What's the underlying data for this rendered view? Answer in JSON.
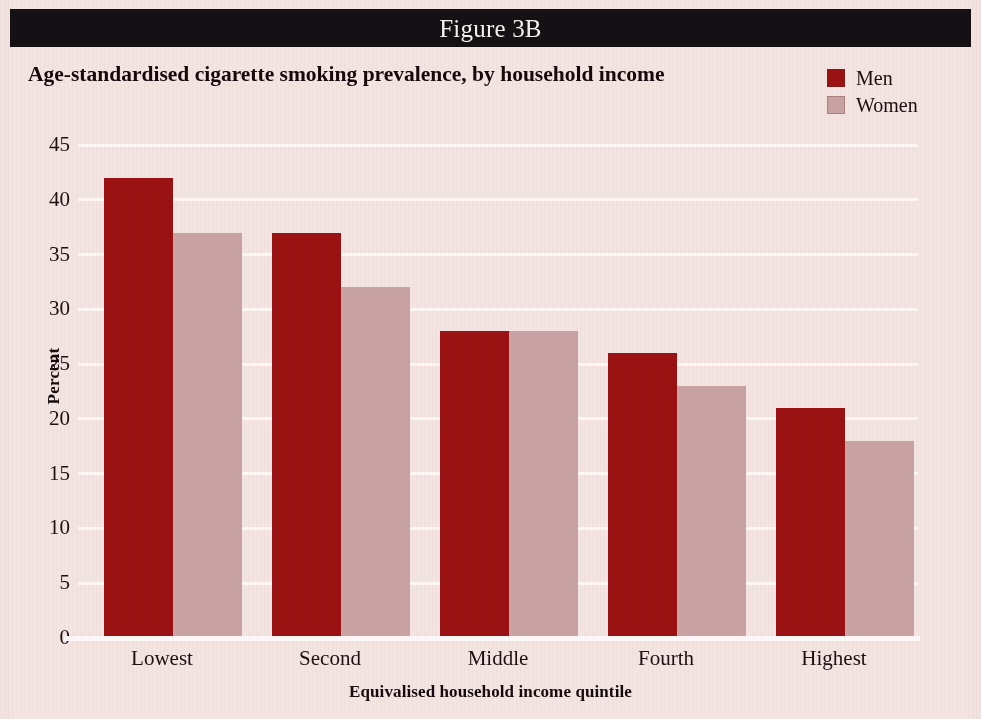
{
  "figure": {
    "banner_label": "Figure 3B",
    "title": "Age-standardised cigarette smoking prevalence, by household income"
  },
  "legend": {
    "items": [
      {
        "label": "Men",
        "color": "#9c1213"
      },
      {
        "label": "Women",
        "color": "#c9a3a4"
      }
    ]
  },
  "colors": {
    "background": "#f3e3e1",
    "banner": "#151013",
    "gridline": "#fdf6f5",
    "men": "#9c1213",
    "women": "#c9a3a4",
    "text": "#1e0f12"
  },
  "chart_data": {
    "type": "bar",
    "title": "Age-standardised cigarette smoking prevalence, by household income",
    "xlabel": "Equivalised household income quintile",
    "ylabel": "Percent",
    "categories": [
      "Lowest",
      "Second",
      "Middle",
      "Fourth",
      "Highest"
    ],
    "series": [
      {
        "name": "Men",
        "color": "#9c1213",
        "values": [
          42,
          37,
          28,
          26,
          21
        ]
      },
      {
        "name": "Women",
        "color": "#c9a3a4",
        "values": [
          37,
          32,
          28,
          23,
          18
        ]
      }
    ],
    "ylim": [
      0,
      45
    ],
    "ytick_values": [
      0,
      5,
      10,
      15,
      20,
      25,
      30,
      35,
      40,
      45
    ],
    "ytick_labels": [
      "0",
      "5",
      "10",
      "15",
      "20",
      "25",
      "30",
      "35",
      "40",
      "45"
    ],
    "grid": true,
    "grid_axis": "y",
    "legend_position": "top-right",
    "bar_group_layout": "grouped"
  }
}
